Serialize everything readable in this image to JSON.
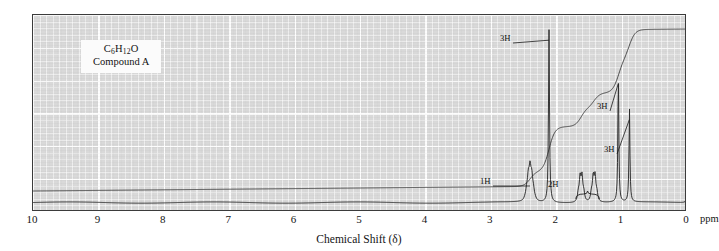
{
  "figure": {
    "label_formula_html": "C6H12O",
    "label_formula_parts": {
      "c": "C",
      "c_n": "6",
      "h": "H",
      "h_n": "12",
      "o": "O"
    },
    "label_compound": "Compound A",
    "axis_title": "Chemical Shift (δ)",
    "axis_unit": "ppm"
  },
  "colors": {
    "plot_background": "#d9d9d9",
    "gridline": "#ffffff",
    "frame": "#3b3b3b",
    "trace": "#2b2b2b",
    "integral": "#3a3a3a",
    "label_box": "#fbfbfb",
    "text": "#141414"
  },
  "chart_data": {
    "type": "line",
    "title": "",
    "subtitle": "",
    "xlabel": "Chemical Shift (δ)",
    "ylabel": "",
    "xunit": "ppm",
    "xlim": [
      10,
      0
    ],
    "x_axis_reversed": true,
    "ylim": [
      0,
      100
    ],
    "grid": true,
    "legend": null,
    "tick_labels": [
      "10",
      "9",
      "8",
      "7",
      "6",
      "5",
      "4",
      "3",
      "2",
      "1",
      "0"
    ],
    "tick_values": [
      10,
      9,
      8,
      7,
      6,
      5,
      4,
      3,
      2,
      1,
      0
    ],
    "minor_ticks_per_major": 10,
    "series": [
      {
        "name": "1H NMR spectrum",
        "kind": "spectrum",
        "peaks": [
          {
            "shift": 2.4,
            "height": 15,
            "multiplicity": "septet",
            "lines": 7,
            "integration": "1H",
            "width": 0.035,
            "spacing": 0.026
          },
          {
            "shift": 2.11,
            "height": 96,
            "multiplicity": "singlet",
            "lines": 1,
            "integration": "3H",
            "width": 0.018
          },
          {
            "shift": 1.62,
            "height": 13,
            "multiplicity": "multiplet",
            "lines": 4,
            "integration": "2H",
            "width": 0.03,
            "spacing": 0.028
          },
          {
            "shift": 1.42,
            "height": 13,
            "multiplicity": "multiplet",
            "lines": 4,
            "integration": "2H",
            "width": 0.03,
            "spacing": 0.028
          },
          {
            "shift": 1.05,
            "height": 72,
            "multiplicity": "singlet",
            "lines": 1,
            "integration": "3H",
            "width": 0.016
          },
          {
            "shift": 0.88,
            "height": 52,
            "multiplicity": "singlet",
            "lines": 1,
            "integration": "3H",
            "width": 0.016
          },
          {
            "shift": 0.0,
            "height": 9,
            "multiplicity": "singlet",
            "lines": 1,
            "integration": "TMS",
            "width": 0.012
          }
        ]
      },
      {
        "name": "Integration trace",
        "kind": "integral",
        "steps": [
          {
            "shift": 2.4,
            "rise": 8
          },
          {
            "shift": 2.11,
            "rise": 24
          },
          {
            "shift": 1.62,
            "rise": 10
          },
          {
            "shift": 1.42,
            "rise": 8
          },
          {
            "shift": 1.05,
            "rise": 18
          },
          {
            "shift": 0.88,
            "rise": 16
          }
        ],
        "baseline": 6,
        "plateau": 92
      }
    ],
    "annotations": [
      {
        "text": "1H",
        "shift": 2.55,
        "label_x": 480,
        "label_y": 176,
        "leader": true
      },
      {
        "text": "3H",
        "shift": 2.11,
        "label_x": 500,
        "label_y": 33,
        "leader": true
      },
      {
        "text": "2H",
        "shift": 1.52,
        "label_x": 548,
        "label_y": 179,
        "leader": false,
        "bracket": true
      },
      {
        "text": "3H",
        "shift": 1.05,
        "label_x": 597,
        "label_y": 101,
        "leader": true
      },
      {
        "text": "3H",
        "shift": 0.88,
        "label_x": 604,
        "label_y": 144,
        "leader": true
      }
    ]
  }
}
